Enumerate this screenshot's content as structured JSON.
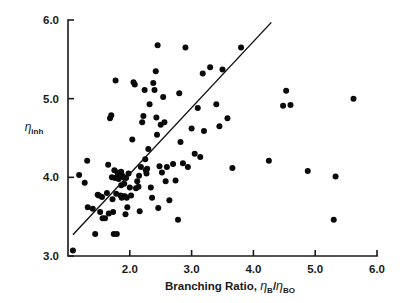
{
  "chart_data": {
    "type": "scatter",
    "title": "",
    "xlabel": "Branching Ratio, ηB/ηBO",
    "xlabel_parts": {
      "prefix": "Branching Ratio, ",
      "eta1": "η",
      "sub1": "B",
      "slash": "/",
      "eta2": "η",
      "sub2": "BO"
    },
    "ylabel": "ηinh",
    "ylabel_parts": {
      "eta": "η",
      "sub": "inh"
    },
    "xlim": [
      1.0,
      6.0
    ],
    "ylim": [
      3.0,
      6.0
    ],
    "xticks": [
      2.0,
      3.0,
      4.0,
      5.0,
      6.0
    ],
    "xtick_labels": [
      "2.0",
      "3.0",
      "4.0",
      "5.0",
      "6.0"
    ],
    "yticks": [
      3.0,
      4.0,
      5.0,
      6.0
    ],
    "ytick_labels": [
      "3.0",
      "4.0",
      "5.0",
      "6.0"
    ],
    "grid": false,
    "legend": null,
    "marker": "filled-circle",
    "marker_color": "#0a0a0a",
    "marker_size_px": 3.0,
    "fit_line": {
      "label": "regression line",
      "x_start": 1.08,
      "y_start": 3.27,
      "x_end": 4.29,
      "y_end": 5.97,
      "color": "#111111"
    },
    "n_points": 118,
    "points": [
      [
        1.08,
        3.07
      ],
      [
        1.18,
        4.03
      ],
      [
        1.27,
        3.93
      ],
      [
        1.31,
        4.21
      ],
      [
        1.32,
        3.62
      ],
      [
        1.4,
        3.6
      ],
      [
        1.44,
        3.28
      ],
      [
        1.48,
        3.78
      ],
      [
        1.5,
        3.77
      ],
      [
        1.52,
        3.56
      ],
      [
        1.55,
        3.75
      ],
      [
        1.56,
        3.48
      ],
      [
        1.6,
        3.48
      ],
      [
        1.63,
        3.8
      ],
      [
        1.65,
        4.16
      ],
      [
        1.66,
        3.54
      ],
      [
        1.68,
        4.75
      ],
      [
        1.7,
        4.79
      ],
      [
        1.71,
        4.0
      ],
      [
        1.72,
        3.72
      ],
      [
        1.73,
        3.56
      ],
      [
        1.74,
        3.28
      ],
      [
        1.75,
        4.09
      ],
      [
        1.76,
        3.99
      ],
      [
        1.77,
        5.23
      ],
      [
        1.78,
        3.79
      ],
      [
        1.79,
        3.28
      ],
      [
        1.8,
        4.06
      ],
      [
        1.81,
        4.03
      ],
      [
        1.82,
        3.98
      ],
      [
        1.83,
        4.04
      ],
      [
        1.84,
        4.01
      ],
      [
        1.85,
        3.77
      ],
      [
        1.86,
        4.07
      ],
      [
        1.86,
        3.9
      ],
      [
        1.87,
        3.74
      ],
      [
        1.88,
        4.02
      ],
      [
        1.89,
        3.76
      ],
      [
        1.9,
        4.0
      ],
      [
        1.91,
        3.92
      ],
      [
        1.92,
        3.76
      ],
      [
        1.93,
        3.53
      ],
      [
        1.94,
        3.99
      ],
      [
        1.95,
        3.74
      ],
      [
        1.96,
        3.62
      ],
      [
        1.98,
        4.05
      ],
      [
        2.0,
        3.87
      ],
      [
        2.02,
        3.77
      ],
      [
        2.04,
        4.48
      ],
      [
        2.06,
        5.21
      ],
      [
        2.08,
        5.18
      ],
      [
        2.1,
        3.86
      ],
      [
        2.12,
        3.95
      ],
      [
        2.14,
        3.88
      ],
      [
        2.15,
        4.02
      ],
      [
        2.16,
        3.57
      ],
      [
        2.18,
        4.13
      ],
      [
        2.2,
        4.7
      ],
      [
        2.22,
        4.78
      ],
      [
        2.24,
        5.11
      ],
      [
        2.25,
        4.23
      ],
      [
        2.26,
        4.09
      ],
      [
        2.27,
        4.05
      ],
      [
        2.28,
        4.11
      ],
      [
        2.3,
        4.36
      ],
      [
        2.32,
        4.93
      ],
      [
        2.34,
        3.87
      ],
      [
        2.36,
        3.74
      ],
      [
        2.38,
        5.2
      ],
      [
        2.4,
        5.11
      ],
      [
        2.42,
        5.35
      ],
      [
        2.43,
        4.76
      ],
      [
        2.44,
        4.54
      ],
      [
        2.45,
        5.68
      ],
      [
        2.46,
        3.61
      ],
      [
        2.48,
        4.14
      ],
      [
        2.5,
        4.67
      ],
      [
        2.52,
        4.06
      ],
      [
        2.54,
        5.02
      ],
      [
        2.56,
        4.7
      ],
      [
        2.58,
        3.95
      ],
      [
        2.6,
        4.13
      ],
      [
        2.64,
        3.71
      ],
      [
        2.7,
        4.17
      ],
      [
        2.74,
        3.96
      ],
      [
        2.78,
        3.46
      ],
      [
        2.8,
        5.07
      ],
      [
        2.82,
        4.45
      ],
      [
        2.86,
        4.18
      ],
      [
        2.9,
        5.65
      ],
      [
        2.94,
        4.13
      ],
      [
        3.0,
        4.62
      ],
      [
        3.05,
        4.3
      ],
      [
        3.1,
        4.88
      ],
      [
        3.14,
        4.26
      ],
      [
        3.18,
        5.32
      ],
      [
        3.2,
        4.59
      ],
      [
        3.3,
        5.4
      ],
      [
        3.4,
        4.93
      ],
      [
        3.45,
        4.65
      ],
      [
        3.5,
        5.37
      ],
      [
        3.58,
        4.75
      ],
      [
        3.66,
        4.12
      ],
      [
        3.8,
        5.65
      ],
      [
        4.25,
        4.21
      ],
      [
        4.48,
        4.91
      ],
      [
        4.53,
        5.1
      ],
      [
        4.6,
        4.92
      ],
      [
        4.88,
        4.08
      ],
      [
        5.3,
        3.46
      ],
      [
        5.33,
        4.01
      ],
      [
        5.62,
        5.0
      ]
    ]
  }
}
